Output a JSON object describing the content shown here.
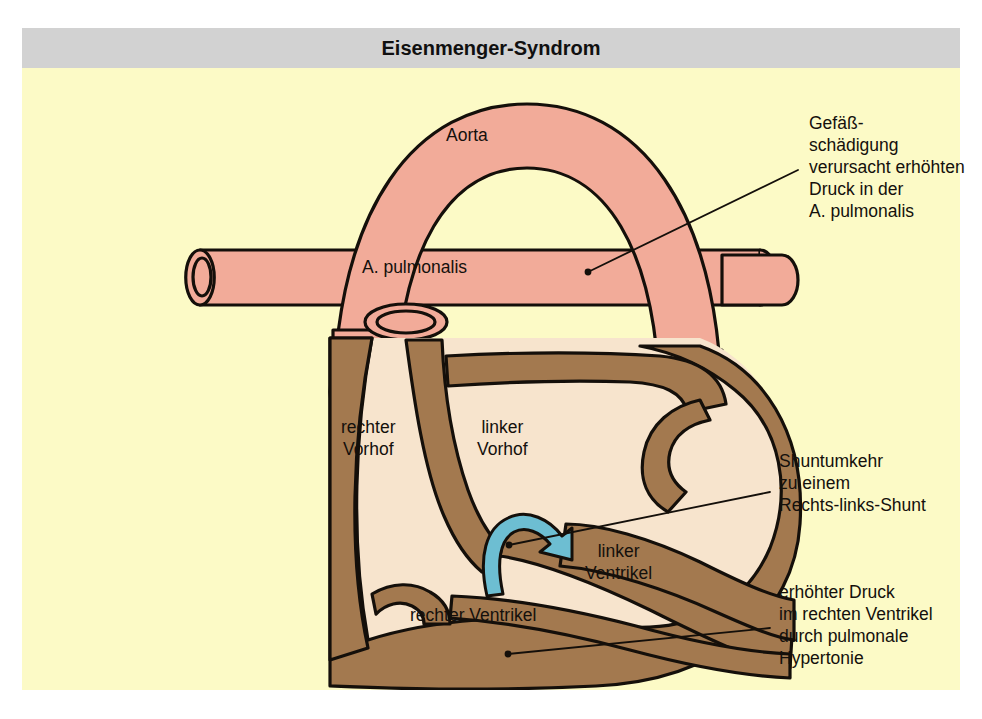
{
  "header": {
    "title": "Eisenmenger-Syndrom"
  },
  "labels": {
    "aorta": "Aorta",
    "pulmonary_artery": "A. pulmonalis",
    "right_atrium": "rechter\nVorhof",
    "left_atrium": "linker\nVorhof",
    "left_ventricle": "linker\nVentrikel",
    "right_ventricle": "rechter Ventrikel"
  },
  "annotations": {
    "vessel_damage": "Gefäß-\nschädigung\nverursacht erhöhten\nDruck in der\nA. pulmonalis",
    "shunt_reversal": "Shuntumkehr\nzu einem\nRechts-links-Shunt",
    "rv_pressure": "erhöhter Druck\nim rechten Ventrikel\ndurch pulmonale\nHypertonie"
  },
  "colors": {
    "page_background": "#ffffff",
    "header_bar": "#d2d2d2",
    "canvas_background": "#fcfac6",
    "vessel_pink": "#f2ab99",
    "muscle_brown": "#a3794f",
    "chamber_cream": "#f7e4cd",
    "outline": "#140f0a",
    "shunt_arrow_blue": "#6dbed2",
    "text": "#14100c"
  }
}
